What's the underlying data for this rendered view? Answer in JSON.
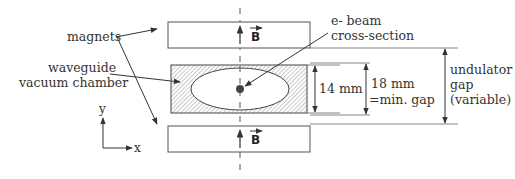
{
  "diagram": {
    "labels": {
      "magnets": "magnets",
      "waveguide_line1": "waveguide",
      "waveguide_line2": "vacuum chamber",
      "ebeam_line1": "e- beam",
      "ebeam_line2": "cross-section",
      "dim_14": "14 mm",
      "dim_18_line1": "18 mm",
      "dim_18_line2": "=min. gap",
      "gap_line1": "undulator",
      "gap_line2": "gap",
      "gap_line3": "(variable)",
      "field_top": "B",
      "field_bottom": "B",
      "axis_y": "y",
      "axis_x": "x"
    },
    "colors": {
      "stroke": "#444444",
      "hatch": "#888888",
      "beam": "#444444",
      "background": "#ffffff"
    }
  }
}
